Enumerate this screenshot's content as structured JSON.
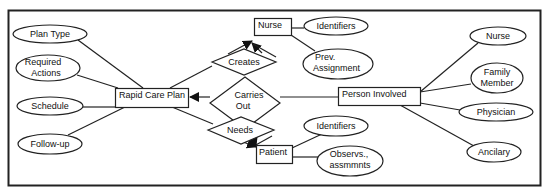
{
  "diagram": {
    "type": "entity-relationship",
    "entities": [
      {
        "id": "rapid_care_plan",
        "label": "Rapid Care Plan"
      },
      {
        "id": "nurse",
        "label": "Nurse"
      },
      {
        "id": "patient",
        "label": "Patient"
      },
      {
        "id": "person_involved",
        "label": "Person Involved"
      }
    ],
    "relationships": [
      {
        "id": "creates",
        "lines": [
          "Creates"
        ],
        "from": "rapid_care_plan",
        "to": "nurse"
      },
      {
        "id": "carries_out",
        "lines": [
          "Carries",
          "Out"
        ],
        "from": "person_involved",
        "to": "rapid_care_plan"
      },
      {
        "id": "needs",
        "lines": [
          "Needs"
        ],
        "from": "rapid_care_plan",
        "to": "patient"
      }
    ],
    "attributes": {
      "rapid_care_plan": [
        {
          "lines": [
            "Plan Type"
          ]
        },
        {
          "lines": [
            "Required",
            "Actions"
          ]
        },
        {
          "lines": [
            "Schedule"
          ]
        },
        {
          "lines": [
            "Follow-up"
          ]
        }
      ],
      "nurse": [
        {
          "lines": [
            "Identifiers"
          ]
        },
        {
          "lines": [
            "Prev.",
            "Assignment"
          ]
        }
      ],
      "patient": [
        {
          "lines": [
            "Identifiers"
          ]
        },
        {
          "lines": [
            "Observs.,",
            "assmmnts"
          ]
        }
      ],
      "person_involved": [
        {
          "lines": [
            "Nurse"
          ]
        },
        {
          "lines": [
            "Family",
            "Member"
          ]
        },
        {
          "lines": [
            "Physician"
          ]
        },
        {
          "lines": [
            "Ancilary"
          ]
        }
      ]
    }
  }
}
